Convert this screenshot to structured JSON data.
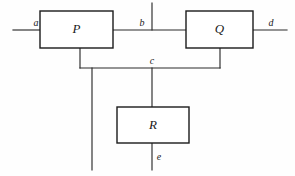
{
  "diagram": {
    "background_color": "#fefefe",
    "line_color": "#2a2a2a",
    "box_stroke_color": "#1b1b1b",
    "box_fill_color": "#ffffff",
    "text_color": "#1a1a1a",
    "blocks": [
      {
        "id": "P",
        "label": "P",
        "x": 40,
        "y": 11,
        "w": 73,
        "h": 37
      },
      {
        "id": "Q",
        "label": "Q",
        "x": 186,
        "y": 11,
        "w": 67,
        "h": 37
      },
      {
        "id": "R",
        "label": "R",
        "x": 117,
        "y": 107,
        "w": 72,
        "h": 36
      }
    ],
    "signals": [
      {
        "id": "a",
        "label": "a",
        "label_x": 36,
        "label_y": 26
      },
      {
        "id": "b",
        "label": "b",
        "label_x": 142,
        "label_y": 26
      },
      {
        "id": "c",
        "label": "c",
        "label_x": 152,
        "label_y": 64
      },
      {
        "id": "d",
        "label": "d",
        "label_x": 271,
        "label_y": 26
      },
      {
        "id": "e",
        "label": "e",
        "label_x": 159,
        "label_y": 160
      }
    ],
    "wires": [
      {
        "id": "input-a-wire",
        "d": "M 13 30 L 40 30"
      },
      {
        "id": "p-to-q-wire",
        "d": "M 113 30 L 186 30"
      },
      {
        "id": "b-tick-wire",
        "d": "M 152 3 L 152 30"
      },
      {
        "id": "output-d-wire",
        "d": "M 253 30 L 287 30"
      },
      {
        "id": "p-bottom-stub",
        "d": "M 80 48 L 80 68"
      },
      {
        "id": "feedback-c-wire",
        "d": "M 80 68 L 220 68"
      },
      {
        "id": "q-bottom-stub",
        "d": "M 220 48 L 220 68"
      },
      {
        "id": "left-branch-wire",
        "d": "M 92 68 L 92 170"
      },
      {
        "id": "c-to-r-wire",
        "d": "M 152 68 L 152 107"
      },
      {
        "id": "r-output-e-wire",
        "d": "M 152 143 L 152 170"
      }
    ]
  }
}
